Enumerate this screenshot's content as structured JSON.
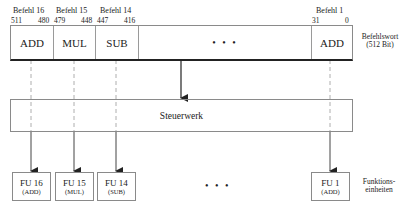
{
  "instruction_word": {
    "label_line1": "Befehlswort",
    "label_line2": "(512 Bit)",
    "ellipsis": "• • •",
    "slots": [
      {
        "name": "Befehl 16",
        "bit_high": "511",
        "bit_low": "480",
        "op": "ADD"
      },
      {
        "name": "Befehl 15",
        "bit_high": "479",
        "bit_low": "448",
        "op": "MUL"
      },
      {
        "name": "Befehl 14",
        "bit_high": "447",
        "bit_low": "416",
        "op": "SUB"
      },
      {
        "name": "Befehl 1",
        "bit_high": "31",
        "bit_low": "0",
        "op": "ADD"
      }
    ]
  },
  "control_unit": {
    "label": "Steuerwerk"
  },
  "functional_units": {
    "label_line1": "Funktions-",
    "label_line2": "einheiten",
    "ellipsis": "• • •",
    "units": [
      {
        "name": "FU 16",
        "op": "(ADD)"
      },
      {
        "name": "FU 15",
        "op": "(MUL)"
      },
      {
        "name": "FU 14",
        "op": "(SUB)"
      },
      {
        "name": "FU 1",
        "op": "(ADD)"
      }
    ]
  }
}
